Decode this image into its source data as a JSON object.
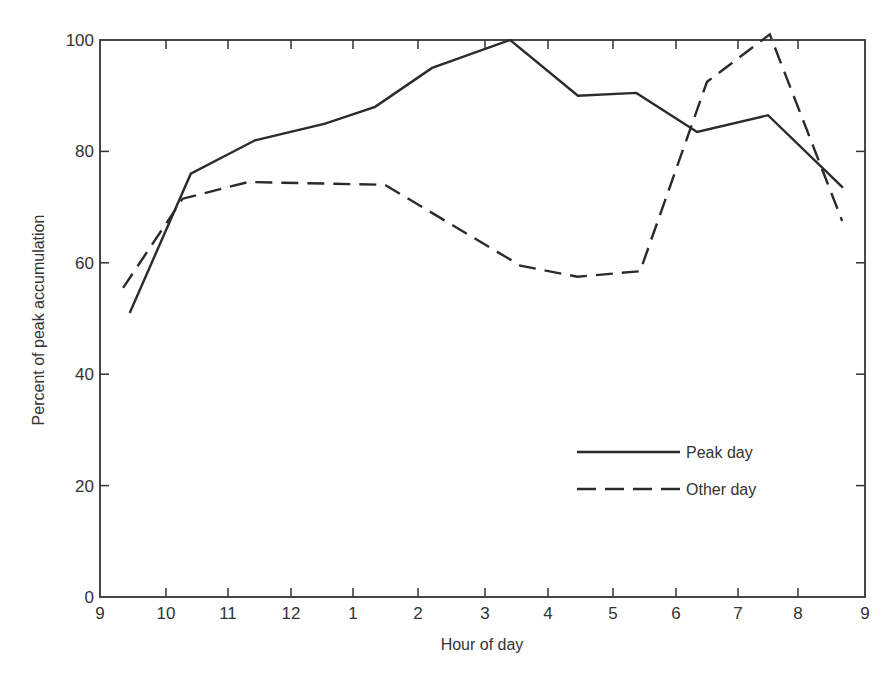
{
  "chart_data": {
    "type": "line",
    "title": "",
    "xlabel": "Hour of day",
    "ylabel": "Percent of peak accumulation",
    "x_tick_labels": [
      "9",
      "10",
      "11",
      "12",
      "1",
      "2",
      "3",
      "4",
      "5",
      "6",
      "7",
      "8",
      "9"
    ],
    "y_ticks": [
      0,
      20,
      40,
      60,
      80,
      100
    ],
    "ylim": [
      0,
      100
    ],
    "xlim_hours_since_9am": [
      0,
      12
    ],
    "grid": false,
    "legend_position": "lower right (inside plot)",
    "x_unit_note": "x values are hours elapsed since 9 AM (0 = 9 AM, 12 = 9 PM)",
    "series": [
      {
        "name": "Peak day",
        "style": "solid",
        "points": [
          {
            "x": 0.45,
            "y": 51
          },
          {
            "x": 1.4,
            "y": 76
          },
          {
            "x": 2.43,
            "y": 82
          },
          {
            "x": 3.55,
            "y": 85
          },
          {
            "x": 4.34,
            "y": 88
          },
          {
            "x": 5.21,
            "y": 95
          },
          {
            "x": 6.4,
            "y": 100
          },
          {
            "x": 7.46,
            "y": 90
          },
          {
            "x": 8.37,
            "y": 90.5
          },
          {
            "x": 9.34,
            "y": 83.5
          },
          {
            "x": 10.5,
            "y": 86.5
          },
          {
            "x": 11.67,
            "y": 73.5
          }
        ]
      },
      {
        "name": "Other day",
        "style": "dashed",
        "points": [
          {
            "x": 0.35,
            "y": 55.5
          },
          {
            "x": 1.27,
            "y": 71.5
          },
          {
            "x": 2.32,
            "y": 74.5
          },
          {
            "x": 4.49,
            "y": 74
          },
          {
            "x": 6.56,
            "y": 59.5
          },
          {
            "x": 7.45,
            "y": 57.5
          },
          {
            "x": 8.43,
            "y": 58.5
          },
          {
            "x": 9.5,
            "y": 92.5
          },
          {
            "x": 10.53,
            "y": 101
          },
          {
            "x": 11.66,
            "y": 67.5
          }
        ]
      }
    ],
    "legend": [
      {
        "label": "Peak day",
        "style": "solid"
      },
      {
        "label": "Other day",
        "style": "dashed"
      }
    ]
  },
  "colors": {
    "line": "#2b2b2b",
    "axis": "#333333",
    "background": "#ffffff"
  }
}
